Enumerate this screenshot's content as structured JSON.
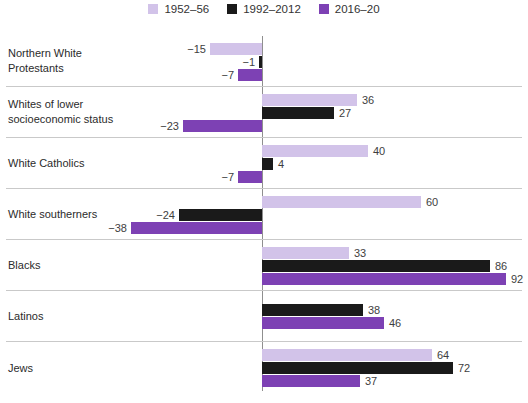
{
  "figure": {
    "background": "#ffffff",
    "separator_color": "#c9c9c9",
    "axis_color": "#8f8f8f",
    "label_color": "#2b2b2b",
    "value_label_color": "#3e3e3e"
  },
  "chart_data": {
    "type": "bar",
    "orientation": "horizontal",
    "title": "",
    "xlabel": "",
    "ylabel": "",
    "xlim": [
      -38,
      92
    ],
    "zero_baseline": true,
    "grid": "row-separator-lines",
    "legend_position": "top-center",
    "value_labels": true,
    "negative_format": "minus-sign-left-of-bar",
    "categories": [
      "Northern White Protestants",
      "Whites of lower socioeconomic status",
      "White Catholics",
      "White southerners",
      "Blacks",
      "Latinos",
      "Jews"
    ],
    "category_label_lines": [
      [
        "Northern White",
        "Protestants"
      ],
      [
        "Whites of lower",
        "socioeconomic status"
      ],
      [
        "White Catholics"
      ],
      [
        "White southerners"
      ],
      [
        "Blacks"
      ],
      [
        "Latinos"
      ],
      [
        "Jews"
      ]
    ],
    "series": [
      {
        "name": "1952–56",
        "color": "#d2c3e9",
        "values": [
          -15,
          36,
          40,
          60,
          33,
          null,
          64
        ]
      },
      {
        "name": "1992–2012",
        "color": "#1a1a1a",
        "values": [
          -1,
          27,
          4,
          -24,
          86,
          38,
          72
        ]
      },
      {
        "name": "2016–20",
        "color": "#7d41b4",
        "values": [
          -7,
          -23,
          -7,
          -38,
          92,
          46,
          37
        ]
      }
    ]
  }
}
